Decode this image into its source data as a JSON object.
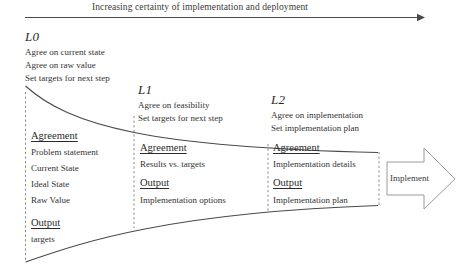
{
  "header": {
    "caption": "Increasing certainty of implementation and deployment",
    "arrow_icon": "right-arrow-icon"
  },
  "levels": [
    {
      "id": "L0",
      "label": "L0",
      "bullets": [
        "Agree on current state",
        "Agree on raw value",
        "Set targets for next step"
      ],
      "agreement_heading": "Agreement",
      "agreement_items": [
        "Problem statement",
        "Current State",
        "Ideal State",
        "Raw Value"
      ],
      "output_heading": "Output",
      "output_items": [
        "targets"
      ]
    },
    {
      "id": "L1",
      "label": "L1",
      "bullets": [
        "Agree on feasibility",
        "Set targets for next step"
      ],
      "agreement_heading": "Agreement",
      "agreement_items": [
        "Results vs. targets"
      ],
      "output_heading": "Output",
      "output_items": [
        "Implementation options"
      ]
    },
    {
      "id": "L2",
      "label": "L2",
      "bullets": [
        "Agree on implementation",
        "Set implementation plan"
      ],
      "agreement_heading": "Agreement",
      "agreement_items": [
        "Implementation details"
      ],
      "output_heading": "Output",
      "output_items": [
        "Implementation plan"
      ]
    }
  ],
  "implement": {
    "label": "Implement",
    "icon": "block-arrow-right-icon"
  },
  "colors": {
    "ink": "#2b2b2b",
    "line": "#4a4a4a",
    "dashed": "#8a8a8a",
    "background": "#ffffff"
  }
}
